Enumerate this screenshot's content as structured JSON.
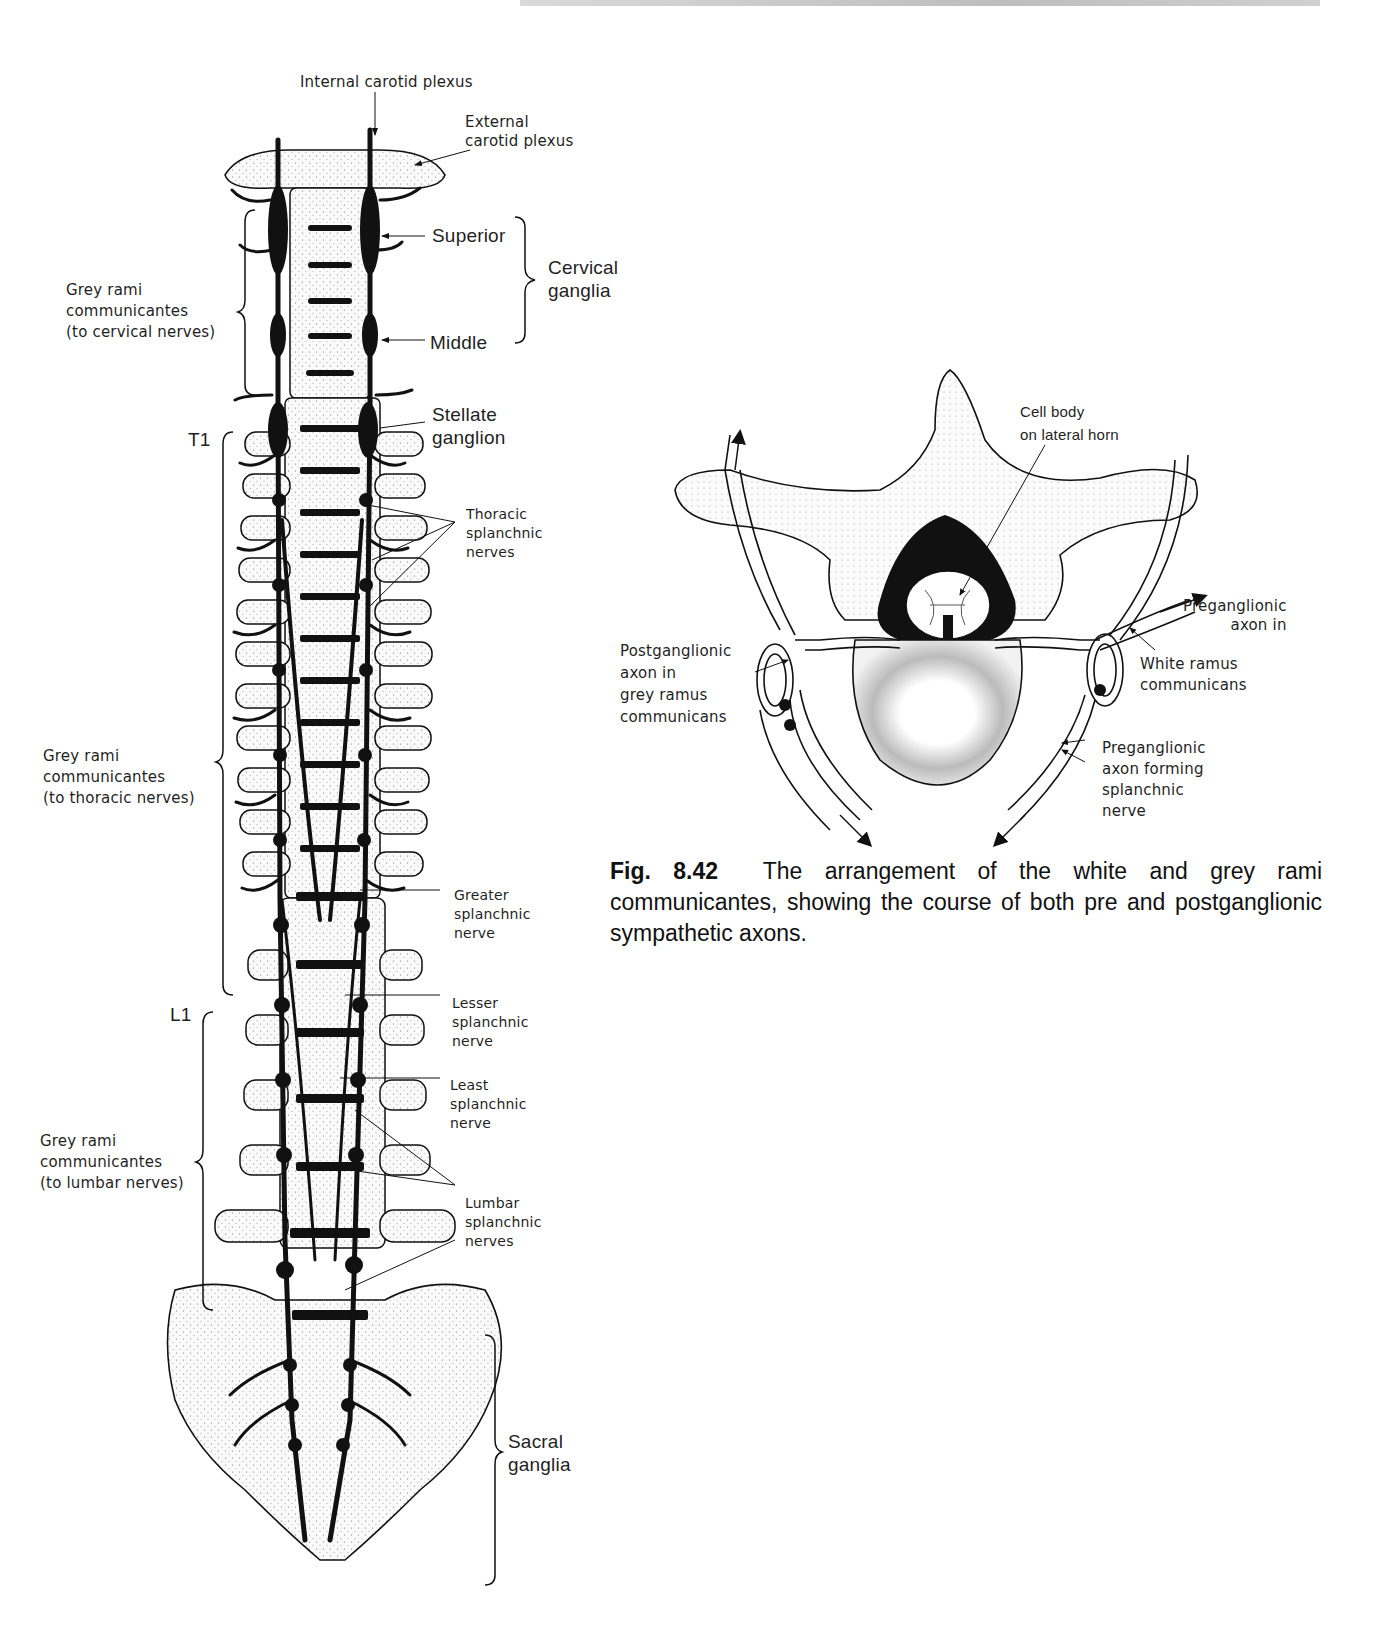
{
  "page": {
    "running_head": ""
  },
  "figure_left": {
    "title": "Sympathetic trunk (anterior view of vertebral column)",
    "labels": {
      "internal_carotid": "Internal carotid plexus",
      "external_carotid": "External\ncarotid plexus",
      "superior": "Superior",
      "middle": "Middle",
      "cervical_ganglia": "Cervical\nganglia",
      "stellate": "Stellate\nganglion",
      "grey_cervical": "Grey rami\ncommunicantes\n(to cervical nerves)",
      "t1": "T1",
      "thoracic_splanchnic": "Thoracic\nsplanchnic\nnerves",
      "grey_thoracic": "Grey rami\ncommunicantes\n(to thoracic nerves)",
      "greater": "Greater\nsplanchnic\nnerve",
      "l1": "L1",
      "lesser": "Lesser\nsplanchnic\nnerve",
      "least": "Least\nsplanchnic\nnerve",
      "grey_lumbar": "Grey rami\ncommunicantes\n(to lumbar nerves)",
      "lumbar_splanchnic": "Lumbar\nsplanchnic\nnerves",
      "sacral_ganglia": "Sacral\nganglia"
    }
  },
  "figure_right": {
    "labels": {
      "cell_body": "Cell body\non lateral horn",
      "pre_axon_in": "Preganglionic\naxon in",
      "white_ramus": "White ramus\ncommunicans",
      "post_axon": "Postganglionic\naxon in\ngrey ramus\ncommunicans",
      "pre_forming": "Preganglionic\naxon forming\nsplanchnic\nnerve"
    }
  },
  "caption": {
    "fig_number": "Fig. 8.42",
    "text": "The arrangement of the white and grey rami communicantes, showing the course of both pre and postganglionic sympathetic axons."
  }
}
